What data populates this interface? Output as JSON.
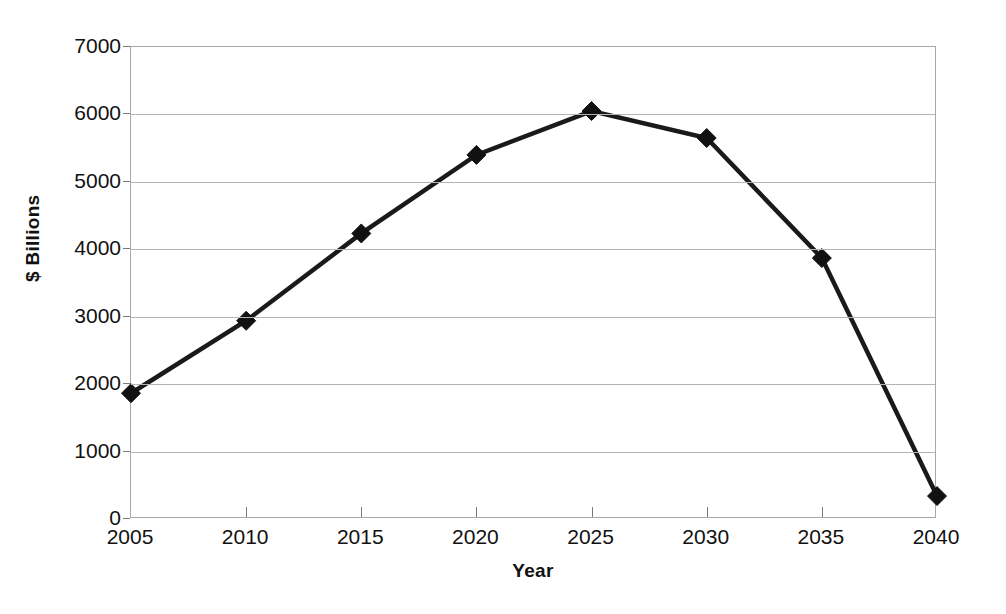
{
  "chart_data": {
    "type": "line",
    "title": "",
    "xlabel": "Year",
    "ylabel": "$ Billions",
    "categories": [
      "2005",
      "2010",
      "2015",
      "2020",
      "2025",
      "2030",
      "2035",
      "2040"
    ],
    "x": [
      2005,
      2010,
      2015,
      2020,
      2025,
      2030,
      2035,
      2040
    ],
    "values": [
      1865,
      2940,
      4235,
      5400,
      6050,
      5650,
      3870,
      340
    ],
    "series": [
      {
        "name": "",
        "values": [
          1865,
          2940,
          4235,
          5400,
          6050,
          5650,
          3870,
          340
        ]
      }
    ],
    "xlim": [
      2005,
      2040
    ],
    "ylim": [
      0,
      7000
    ],
    "ytick_labels": [
      "7000",
      "6000",
      "5000",
      "4000",
      "3000",
      "2000",
      "1000",
      "0"
    ],
    "ytick_values": [
      7000,
      6000,
      5000,
      4000,
      3000,
      2000,
      1000,
      0
    ],
    "xtick_labels": [
      "2005",
      "2010",
      "2015",
      "2020",
      "2025",
      "2030",
      "2035",
      "2040"
    ],
    "grid": "horizontal",
    "legend": "none",
    "marker": "diamond",
    "line_color": "#1a1a1a",
    "marker_color": "#111111",
    "grid_color": "#b4b4b4",
    "axis_color": "#a8a8a8",
    "background_color": "#ffffff",
    "line_width": 4
  }
}
